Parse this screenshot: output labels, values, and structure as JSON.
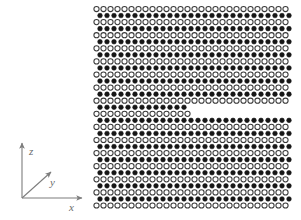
{
  "figure": {
    "kind": "crystal-lattice-schematic",
    "background": "#ffffff",
    "width": 301,
    "height": 220
  },
  "axes": {
    "name": "coordinate-triad",
    "origin": {
      "x": 22,
      "y": 198
    },
    "stroke": "#7d7d7d",
    "labels": {
      "x": "x",
      "y": "y",
      "z": "z"
    },
    "arrows": [
      {
        "axis": "z",
        "to": {
          "x": 22,
          "y": 143
        },
        "label_at": {
          "x": 29,
          "y": 155
        }
      },
      {
        "axis": "y",
        "to": {
          "x": 51,
          "y": 172
        },
        "label_at": {
          "x": 50,
          "y": 186
        }
      },
      {
        "axis": "x",
        "to": {
          "x": 82,
          "y": 198
        },
        "label_at": {
          "x": 69,
          "y": 211
        }
      }
    ]
  },
  "lattice": {
    "name": "atom-lattice",
    "origin": {
      "x": 96.5,
      "y": 9.0
    },
    "col_spacing": 7.0,
    "row_spacing": 6.55,
    "cols": 28,
    "rows": 31,
    "row_offset_fraction": 0.5,
    "open_atom": {
      "radius": 2.6,
      "fill": "#ffffff",
      "stroke": "#3a3a3a",
      "stroke_width": 1.05
    },
    "filled_atom": {
      "radius": 2.3,
      "fill": "#161616",
      "stroke": "#161616",
      "stroke_width": 0.6
    },
    "pattern_note": "even rows are open circles, odd rows are filled circles offset half a period",
    "void": {
      "name": "horizontal-crack",
      "x_start": 190,
      "x_end": 301,
      "row_start": 15,
      "row_end": 16,
      "description": "two atomic rows missing on the right half, producing a step dislocation"
    }
  }
}
